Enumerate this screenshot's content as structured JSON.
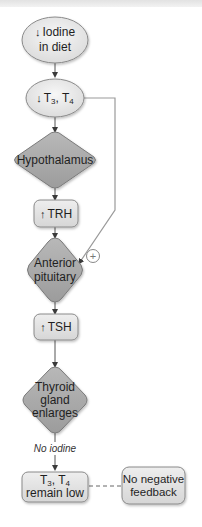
{
  "diagram": {
    "nodes": {
      "iodine": {
        "arrow": "↓",
        "line1": "Iodine",
        "line2": "in diet",
        "shape": "ellipse"
      },
      "t3t4_low": {
        "arrow": "↓",
        "t3": "T",
        "t3_sub": "3",
        "sep": ", ",
        "t4": "T",
        "t4_sub": "4",
        "shape": "ellipse"
      },
      "hypothalamus": {
        "label": "Hypothalamus",
        "shape": "diamond"
      },
      "trh": {
        "arrow": "↑",
        "label": "TRH",
        "shape": "rounded-rect"
      },
      "anterior_pituitary": {
        "line1": "Anterior",
        "line2": "pituitary",
        "shape": "diamond"
      },
      "tsh": {
        "arrow": "↑",
        "label": "TSH",
        "shape": "rounded-rect"
      },
      "thyroid": {
        "line1": "Thyroid",
        "line2": "gland",
        "line3": "enlarges",
        "shape": "diamond"
      },
      "t3t4_remain": {
        "t3": "T",
        "t3_sub": "3",
        "sep": ", ",
        "t4": "T",
        "t4_sub": "4",
        "line2": "remain low",
        "shape": "rounded-rect"
      },
      "no_feedback": {
        "line1": "No negative",
        "line2": "feedback",
        "shape": "rounded-rect"
      }
    },
    "edges": {
      "no_iodine_label": "No iodine",
      "feedback_sign": "+"
    },
    "colors": {
      "ellipse_fill": "#ececec",
      "rect_fill": "#e4e4e4",
      "diamond_fill": "#a9a9a9",
      "stroke": "#8a8a8a",
      "line": "#9a9a9a",
      "text": "#1f1f1f"
    }
  }
}
